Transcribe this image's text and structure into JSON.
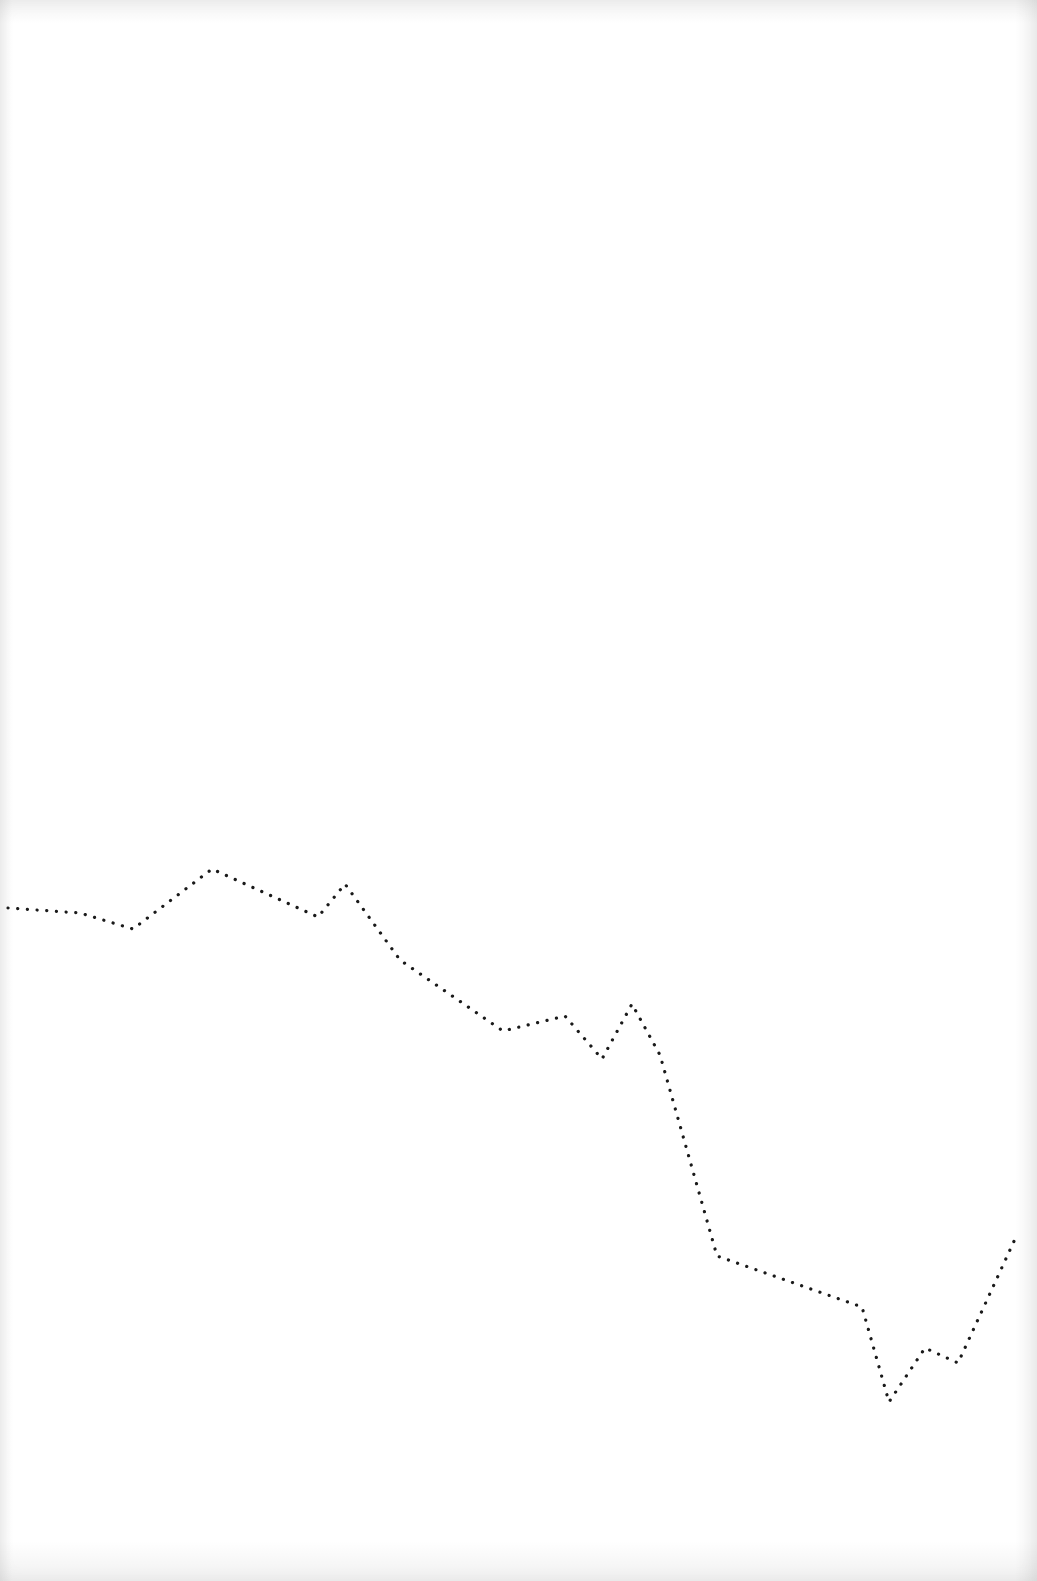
{
  "chart_data": {
    "type": "line",
    "title": "",
    "xlabel": "",
    "ylabel": "",
    "grid": false,
    "legend": null,
    "line_style": "dotted",
    "line_color": "#1a1a1a",
    "background_color": "#ffffff",
    "x": [
      0,
      1,
      2,
      3,
      4,
      5,
      6,
      7,
      8,
      9,
      10,
      11,
      12,
      13,
      14,
      15,
      16,
      17
    ],
    "series": [
      {
        "name": "line",
        "pixel_points": [
          [
            8,
            908
          ],
          [
            80,
            913
          ],
          [
            133,
            929
          ],
          [
            212,
            869
          ],
          [
            318,
            917
          ],
          [
            345,
            884
          ],
          [
            400,
            960
          ],
          [
            503,
            1031
          ],
          [
            565,
            1016
          ],
          [
            602,
            1059
          ],
          [
            632,
            1004
          ],
          [
            660,
            1055
          ],
          [
            717,
            1256
          ],
          [
            862,
            1307
          ],
          [
            889,
            1402
          ],
          [
            925,
            1348
          ],
          [
            958,
            1363
          ],
          [
            1015,
            1239
          ]
        ],
        "values": [
          67,
          66,
          63,
          74,
          65,
          71,
          57,
          44,
          47,
          39,
          49,
          40,
          3,
          -7,
          -24,
          -14,
          -17,
          6
        ]
      }
    ],
    "note_on_values": "No axes or tick labels are visible; values are relative heights estimated from pixel positions (higher = larger)."
  }
}
